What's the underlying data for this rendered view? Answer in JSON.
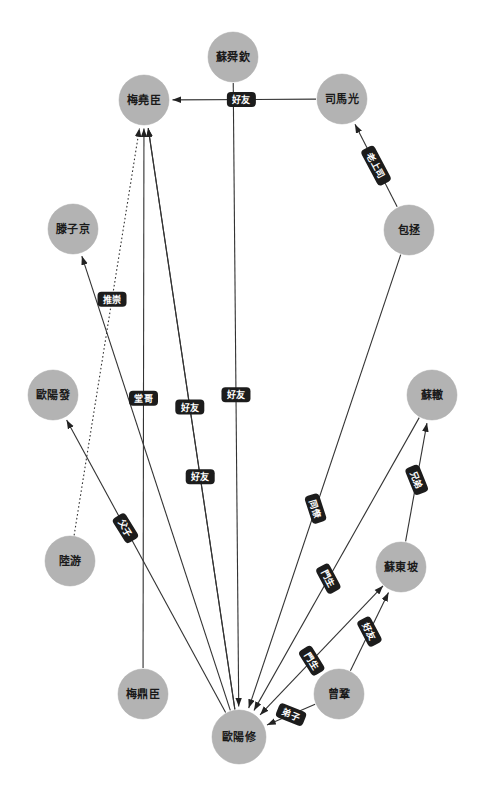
{
  "diagram": {
    "type": "directed-graph",
    "title": "",
    "node_fill": "#b3b3b3",
    "edge_color": "#333333",
    "label_bg": "#1c1c1c",
    "label_fg": "#ffffff",
    "nodes": [
      {
        "id": "susq",
        "label": "蘇舜欽",
        "x": 233,
        "y": 57,
        "r": 25
      },
      {
        "id": "meiyc",
        "label": "梅堯臣",
        "x": 144,
        "y": 100,
        "r": 25
      },
      {
        "id": "simag",
        "label": "司馬光",
        "x": 342,
        "y": 99,
        "r": 25
      },
      {
        "id": "baozh",
        "label": "包拯",
        "x": 409,
        "y": 230,
        "r": 25
      },
      {
        "id": "tengzj",
        "label": "滕子京",
        "x": 73,
        "y": 229,
        "r": 25
      },
      {
        "id": "oyf",
        "label": "歐陽發",
        "x": 53,
        "y": 395,
        "r": 25
      },
      {
        "id": "suzhe",
        "label": "蘇轍",
        "x": 432,
        "y": 395,
        "r": 25
      },
      {
        "id": "luyou",
        "label": "陸游",
        "x": 70,
        "y": 561,
        "r": 25
      },
      {
        "id": "sudp",
        "label": "蘇東坡",
        "x": 401,
        "y": 567,
        "r": 25
      },
      {
        "id": "meidc",
        "label": "梅鼎臣",
        "x": 143,
        "y": 694,
        "r": 25
      },
      {
        "id": "zenggo",
        "label": "曾鞏",
        "x": 339,
        "y": 694,
        "r": 25
      },
      {
        "id": "oyx",
        "label": "歐陽修",
        "x": 239,
        "y": 737,
        "r": 27
      }
    ],
    "edges": [
      {
        "id": "e1",
        "source": "susq",
        "target": "oyx",
        "label": "好友",
        "style": "solid",
        "arrow": "target",
        "label_t": 0.5,
        "label_rot": 0
      },
      {
        "id": "e2",
        "source": "simag",
        "target": "meiyc",
        "label": "好友",
        "style": "solid",
        "arrow": "target",
        "label_t": 0.52,
        "label_rot": 0
      },
      {
        "id": "e3",
        "source": "baozh",
        "target": "simag",
        "label": "老上司",
        "style": "solid",
        "arrow": "target",
        "label_t": 0.5,
        "label_rot": 62
      },
      {
        "id": "e4",
        "source": "baozh",
        "target": "oyx",
        "label": "同僚",
        "style": "solid",
        "arrow": "target",
        "label_t": 0.56,
        "label_rot": 72
      },
      {
        "id": "e5",
        "source": "oyx",
        "target": "tengzj",
        "label": "",
        "style": "solid",
        "arrow": "target",
        "label_t": 0.5,
        "label_rot": 0
      },
      {
        "id": "e6",
        "source": "oyx",
        "target": "oyf",
        "label": "父子",
        "style": "solid",
        "arrow": "target",
        "label_t": 0.63,
        "label_rot": 58
      },
      {
        "id": "e7",
        "source": "luyou",
        "target": "meiyc",
        "label": "推崇",
        "style": "dotted",
        "arrow": "target",
        "label_t": 0.58,
        "label_rot": 0
      },
      {
        "id": "e8",
        "source": "meidc",
        "target": "meiyc",
        "label": "堂哥",
        "style": "solid",
        "arrow": "target",
        "label_t": 0.5,
        "label_rot": 0
      },
      {
        "id": "e9",
        "source": "oyx",
        "target": "meiyc",
        "label": "好友",
        "style": "solid",
        "arrow": "target",
        "label_t": 0.52,
        "label_rot": 0
      },
      {
        "id": "e10",
        "source": "suzhe",
        "target": "oyx",
        "label": "門生",
        "style": "solid",
        "arrow": "target",
        "label_t": 0.55,
        "label_rot": 62
      },
      {
        "id": "e11",
        "source": "sudp",
        "target": "suzhe",
        "label": "兄弟",
        "style": "solid",
        "arrow": "target",
        "label_t": 0.52,
        "label_rot": 68
      },
      {
        "id": "e12",
        "source": "sudp",
        "target": "oyx",
        "label": "門生",
        "style": "solid",
        "arrow": "both",
        "label_t": 0.58,
        "label_rot": 58
      },
      {
        "id": "e13",
        "source": "zenggo",
        "target": "sudp",
        "label": "好友",
        "style": "solid",
        "arrow": "target",
        "label_t": 0.5,
        "label_rot": 62
      },
      {
        "id": "e14",
        "source": "zenggo",
        "target": "oyx",
        "label": "弟子",
        "style": "solid",
        "arrow": "target",
        "label_t": 0.5,
        "label_rot": 22
      },
      {
        "id": "e15",
        "source": "oyx",
        "target": "meiyc",
        "label": "好友",
        "style": "solid",
        "arrow": "target",
        "label_t": 0.4,
        "label_rot": 0,
        "bow": 1
      }
    ]
  }
}
